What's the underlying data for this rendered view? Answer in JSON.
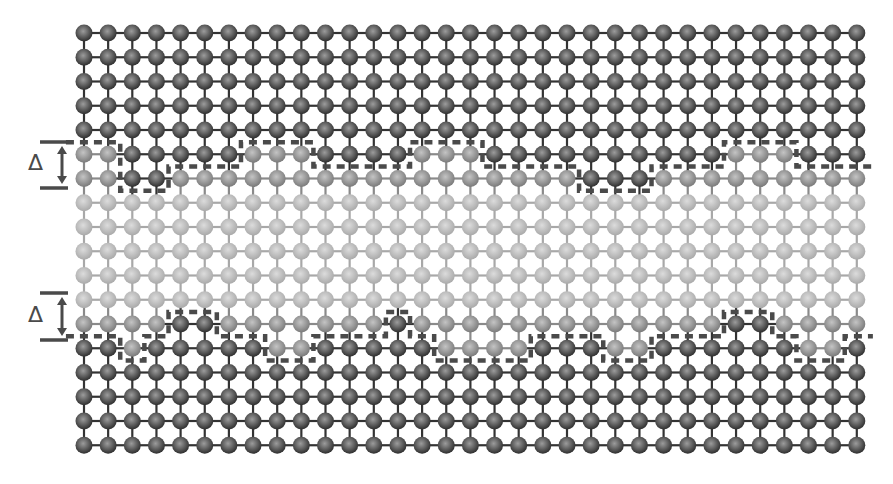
{
  "figure": {
    "grid": {
      "columns": 33,
      "rows": 18,
      "origin_x": 84,
      "origin_y": 33,
      "spacing_x": 24.15,
      "spacing_y": 24.25,
      "atom_radius": 8.5
    },
    "colors": {
      "dark_atom_edge": "#2e2e2e",
      "dark_atom_center": "#9c9c9c",
      "dark_bond": "#333333",
      "medium_atom_edge": "#7a7a7a",
      "medium_atom_center": "#c4c4c4",
      "medium_bond": "#8a8a8a",
      "light_atom_edge": "#a9a9a9",
      "light_atom_center": "#dcdcdc",
      "light_bond": "#a8a8a8",
      "dash": "#4a4a4a",
      "marker": "#4a4a4a",
      "background": "#ffffff"
    },
    "row_types": [
      "dark",
      "dark",
      "dark",
      "dark",
      "dark",
      "iface",
      "iface",
      "light",
      "light",
      "light",
      "light",
      "light",
      "iface",
      "iface",
      "dark",
      "dark",
      "dark",
      "dark"
    ],
    "interfaces": {
      "top": {
        "rows": [
          5,
          6
        ],
        "row5": "mmdddddmmmddddmmmddddddddddmmmddd",
        "row6": "mmddmmmmmmmmmmmmmmmmmdddmmmmmmmmm",
        "dark_side": "above"
      },
      "bottom": {
        "rows": [
          12,
          13
        ],
        "row12": "mmmmddmmmmmmmdmmmmmmmmmmmmmddmmmm",
        "row13": "ddmdddddmmdddddmmmmdddmmddddddmmd",
        "dark_side": "below"
      }
    },
    "markers": [
      {
        "id": "delta-top",
        "label": "Δ",
        "top_y": 142,
        "bottom_y": 188,
        "bar_x1": 40,
        "bar_x2": 68,
        "arrow_x": 62,
        "label_x": 28,
        "label_y": 155
      },
      {
        "id": "delta-bottom",
        "label": "Δ",
        "top_y": 293,
        "bottom_y": 340,
        "bar_x1": 40,
        "bar_x2": 68,
        "arrow_x": 62,
        "label_x": 28,
        "label_y": 306
      }
    ]
  }
}
